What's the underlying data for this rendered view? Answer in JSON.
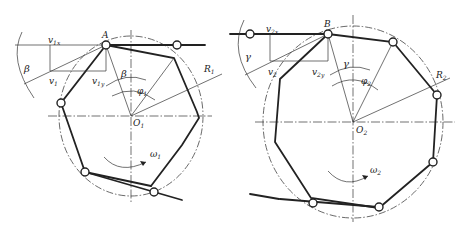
{
  "diagram": {
    "type": "chain drive polygon effect kinematics",
    "left_sprocket": {
      "center_label": "O",
      "center_sub": "1",
      "point_label": "A",
      "velocity_label": "v",
      "velocity_sub": "1",
      "velocity_x_label": "v",
      "velocity_x_sub": "1x",
      "velocity_y_label": "v",
      "velocity_y_sub": "1y",
      "angle_label": "β",
      "angle_label_2": "β",
      "pitch_angle_label": "φ",
      "pitch_angle_sub": "1",
      "radius_label": "R",
      "radius_sub": "1",
      "omega_label": "ω",
      "omega_sub": "1"
    },
    "right_sprocket": {
      "center_label": "O",
      "center_sub": "2",
      "point_label": "B",
      "velocity_label": "v",
      "velocity_sub": "2",
      "velocity_x_label": "v",
      "velocity_x_sub": "2x",
      "velocity_y_label": "v",
      "velocity_y_sub": "2y",
      "angle_label": "γ",
      "angle_label_2": "γ",
      "pitch_angle_label": "φ",
      "pitch_angle_sub": "2",
      "radius_label": "R",
      "radius_sub": "2",
      "omega_label": "ω",
      "omega_sub": "2"
    }
  }
}
